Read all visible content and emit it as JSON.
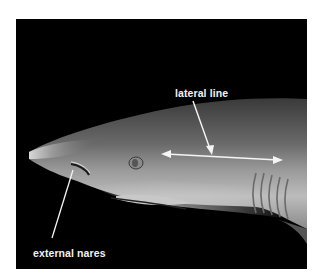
{
  "figure": {
    "background_color": "#000000",
    "annotations": [
      {
        "id": "lateral-line",
        "label": "lateral line",
        "pointer": "arrow to double-headed line along flank"
      },
      {
        "id": "external-nares",
        "label": "external nares",
        "pointer": "line to nostril under snout"
      }
    ],
    "colors": {
      "label": "#f2f2f2",
      "arrow": "#f5f5f5"
    }
  }
}
